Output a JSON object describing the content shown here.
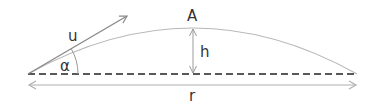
{
  "diagram": {
    "labels": {
      "apex": "A",
      "velocity": "u",
      "height": "h",
      "angle": "α",
      "range": "r"
    },
    "colors": {
      "trajectory": "#b8b8b8",
      "velocity_vector": "#8a8a8a",
      "baseline": "#222222",
      "range_arrow": "#b0b0b0",
      "height_arrow": "#9a9a9a",
      "angle_arc": "#9a9a9a",
      "text": "#333333"
    }
  }
}
